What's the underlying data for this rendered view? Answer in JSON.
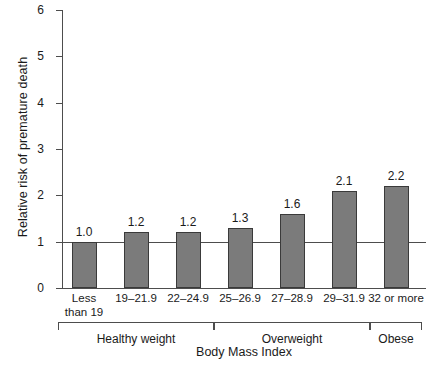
{
  "chart_data": {
    "type": "bar",
    "title": "",
    "xlabel": "Body Mass Index",
    "ylabel": "Relative risk of premature death",
    "categories": [
      "Less\nthan 19",
      "19–21.9",
      "22–24.9",
      "25–26.9",
      "27–28.9",
      "29–31.9",
      "32 or more"
    ],
    "values": [
      1.0,
      1.2,
      1.2,
      1.3,
      1.6,
      2.1,
      2.2
    ],
    "value_labels": [
      "1.0",
      "1.2",
      "1.2",
      "1.3",
      "1.6",
      "2.1",
      "2.2"
    ],
    "ylim": [
      0,
      6
    ],
    "yticks": [
      0,
      1,
      2,
      3,
      4,
      5,
      6
    ],
    "ytick_labels": [
      "0",
      "1",
      "2",
      "3",
      "4",
      "5",
      "6"
    ],
    "grid": false,
    "legend": "none",
    "reference_line": {
      "value": 1.0,
      "label": "1"
    },
    "groups": [
      {
        "label": "Healthy weight",
        "first_index": 0,
        "last_index": 2
      },
      {
        "label": "Overweight",
        "first_index": 3,
        "last_index": 5
      },
      {
        "label": "Obese",
        "first_index": 6,
        "last_index": 6
      }
    ],
    "colors": {
      "bar_fill": "#7b7b7b",
      "bar_edge": "#3a3a3a",
      "axis": "#4d4d4d",
      "text": "#1a1a1a",
      "background": "#ffffff"
    }
  }
}
